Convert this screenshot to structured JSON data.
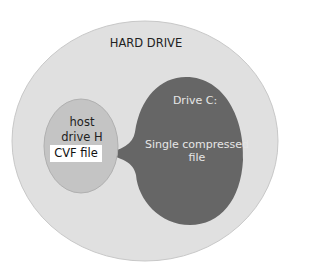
{
  "diagram": {
    "outer": {
      "label": "HARD DRIVE",
      "fill": "#e0e0e0"
    },
    "drive_c": {
      "title": "Drive C:",
      "content": "Single compressed file",
      "fill": "#666666"
    },
    "host": {
      "label_line1": "host",
      "label_line2": "drive H",
      "fill": "#c4c4c4"
    },
    "cvf": {
      "label": "CVF file"
    }
  }
}
